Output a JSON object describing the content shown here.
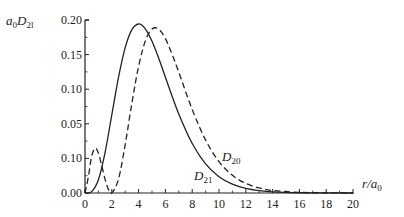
{
  "chart_data": {
    "type": "line",
    "title": "",
    "xlabel": "r/a0",
    "ylabel": "a0 D2l",
    "xlim": [
      0,
      20
    ],
    "ylim": [
      0,
      0.2
    ],
    "grid": false,
    "legend": "inline curve labels",
    "x_ticks": [
      "0",
      "2",
      "4",
      "6",
      "8",
      "10",
      "12",
      "14",
      "16",
      "18",
      "20"
    ],
    "y_ticks": [
      "0.00",
      "0.10",
      "0.05",
      "0.10",
      "0.15",
      "0.20"
    ],
    "y_tick_values": [
      0.0,
      0.01,
      0.05,
      0.1,
      0.15,
      0.2
    ],
    "y_tick_positions": [
      0.0,
      0.04,
      0.08,
      0.12,
      0.16,
      0.2
    ],
    "series": [
      {
        "name": "D21",
        "style": "solid",
        "label_base": "D",
        "label_sub": "21",
        "x": [
          0,
          0.5,
          1,
          1.5,
          2,
          2.5,
          3,
          3.5,
          4,
          4.5,
          5,
          5.5,
          6,
          7,
          8,
          9,
          10,
          11,
          12,
          13,
          14,
          16,
          18,
          20
        ],
        "y": [
          0,
          0.0016,
          0.0153,
          0.0471,
          0.0902,
          0.1336,
          0.168,
          0.1888,
          0.1954,
          0.1898,
          0.1755,
          0.1559,
          0.1339,
          0.0912,
          0.0573,
          0.0337,
          0.0189,
          0.0102,
          0.0053,
          0.0027,
          0.0013,
          0.0003,
          0.0001,
          0
        ]
      },
      {
        "name": "D20",
        "style": "dashed",
        "label_base": "D",
        "label_sub": "20",
        "x": [
          0,
          0.25,
          0.5,
          0.76,
          1,
          1.25,
          1.5,
          1.75,
          2,
          2.5,
          3,
          3.5,
          4,
          4.5,
          5,
          5.5,
          6,
          6.5,
          7,
          8,
          9,
          10,
          11,
          12,
          13,
          14,
          16,
          18,
          20
        ],
        "y": [
          0,
          0.0186,
          0.0426,
          0.0519,
          0.046,
          0.0315,
          0.0157,
          0.0042,
          0,
          0.016,
          0.056,
          0.104,
          0.1465,
          0.1756,
          0.1895,
          0.1894,
          0.1785,
          0.1604,
          0.1396,
          0.0966,
          0.0612,
          0.0363,
          0.0205,
          0.0111,
          0.0058,
          0.0029,
          0.0007,
          0.0002,
          0
        ]
      }
    ]
  },
  "labels": {
    "ylabel_a": "a",
    "ylabel_a_sub": "0",
    "ylabel_D": "D",
    "ylabel_D_sub": "2l",
    "xlabel_r": "r/a",
    "xlabel_sub": "0"
  }
}
